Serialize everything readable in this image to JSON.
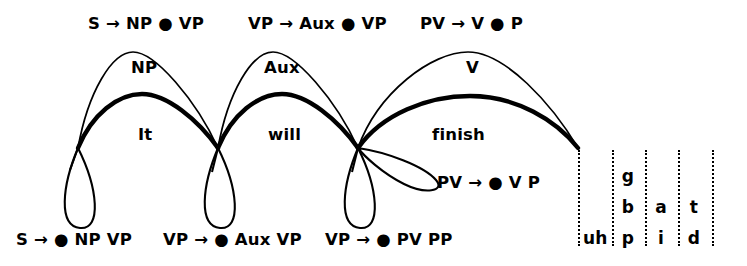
{
  "figure": {
    "type": "chart-parser-lattice"
  },
  "top_rules": [
    {
      "text": "S → NP ● VP",
      "x": 88,
      "y": 16
    },
    {
      "text": "VP → Aux ● VP",
      "x": 248,
      "y": 16
    },
    {
      "text": "PV → V ● P",
      "x": 420,
      "y": 16
    }
  ],
  "category_labels": [
    {
      "text": "NP",
      "x": 131,
      "y": 60
    },
    {
      "text": "Aux",
      "x": 264,
      "y": 60
    },
    {
      "text": "V",
      "x": 466,
      "y": 60
    }
  ],
  "word_labels": [
    {
      "text": "It",
      "x": 138,
      "y": 127
    },
    {
      "text": "will",
      "x": 268,
      "y": 127
    },
    {
      "text": "finish",
      "x": 432,
      "y": 127
    }
  ],
  "bottom_rules": [
    {
      "text": "S → ● NP VP",
      "x": 16,
      "y": 232
    },
    {
      "text": "VP → ● Aux VP",
      "x": 163,
      "y": 232
    },
    {
      "text": "VP → ● PV PP",
      "x": 325,
      "y": 232
    }
  ],
  "inline_rules": [
    {
      "text": "PV → ● V P",
      "x": 437,
      "y": 175
    }
  ],
  "nodes": [
    {
      "x": 78,
      "y": 148
    },
    {
      "x": 218,
      "y": 148
    },
    {
      "x": 358,
      "y": 148
    },
    {
      "x": 578,
      "y": 148
    }
  ],
  "lattice": {
    "columns": [
      {
        "x": 578
      },
      {
        "x": 612
      },
      {
        "x": 645
      },
      {
        "x": 678
      },
      {
        "x": 712
      }
    ],
    "cells": [
      {
        "text": "g",
        "x": 628,
        "y": 168
      },
      {
        "text": "b",
        "x": 628,
        "y": 199
      },
      {
        "text": "a",
        "x": 661,
        "y": 199
      },
      {
        "text": "t",
        "x": 694,
        "y": 199
      },
      {
        "text": "uh",
        "x": 595,
        "y": 230
      },
      {
        "text": "p",
        "x": 628,
        "y": 230
      },
      {
        "text": "i",
        "x": 661,
        "y": 230
      },
      {
        "text": "d",
        "x": 694,
        "y": 230
      }
    ]
  },
  "colors": {
    "ink": "#000000",
    "background": "#ffffff"
  }
}
